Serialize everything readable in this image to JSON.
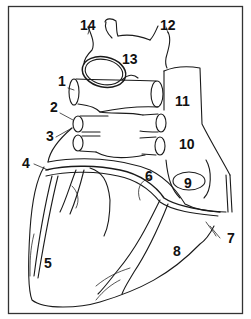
{
  "figure": {
    "frame_color": "#333333",
    "stroke_color": "#1a1a1a",
    "background": "#ffffff"
  },
  "labels": [
    {
      "id": "1",
      "text": "1",
      "x": 58,
      "y": 86
    },
    {
      "id": "2",
      "text": "2",
      "x": 50,
      "y": 112
    },
    {
      "id": "3",
      "text": "3",
      "x": 46,
      "y": 141
    },
    {
      "id": "4",
      "text": "4",
      "x": 22,
      "y": 168
    },
    {
      "id": "5",
      "text": "5",
      "x": 44,
      "y": 268
    },
    {
      "id": "6",
      "text": "6",
      "x": 145,
      "y": 181
    },
    {
      "id": "7",
      "text": "7",
      "x": 227,
      "y": 243
    },
    {
      "id": "8",
      "text": "8",
      "x": 173,
      "y": 256
    },
    {
      "id": "9",
      "text": "9",
      "x": 186,
      "y": 188
    },
    {
      "id": "10",
      "text": "10",
      "x": 179,
      "y": 149
    },
    {
      "id": "11",
      "text": "11",
      "x": 175,
      "y": 106
    },
    {
      "id": "12",
      "text": "12",
      "x": 160,
      "y": 30
    },
    {
      "id": "13",
      "text": "13",
      "x": 122,
      "y": 64
    },
    {
      "id": "14",
      "text": "14",
      "x": 80,
      "y": 30
    }
  ]
}
